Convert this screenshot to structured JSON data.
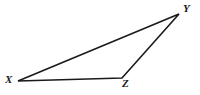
{
  "figure": {
    "type": "geometry-diagram",
    "shape": "triangle",
    "name": "Triangle XYZ",
    "background_color": "#ffffff",
    "stroke_color": "#1a1a1a",
    "stroke_width": 1.6,
    "canvas": {
      "width": 200,
      "height": 95
    },
    "vertices": [
      {
        "id": "X",
        "label": "X",
        "point": {
          "x": 18,
          "y": 81
        },
        "label_position": {
          "x": 5,
          "y": 74
        }
      },
      {
        "id": "Y",
        "label": "Y",
        "point": {
          "x": 179,
          "y": 14
        },
        "label_position": {
          "x": 183,
          "y": 3
        }
      },
      {
        "id": "Z",
        "label": "Z",
        "point": {
          "x": 122,
          "y": 78
        },
        "label_position": {
          "x": 122,
          "y": 78
        }
      }
    ],
    "edges": [
      {
        "id": "XY",
        "from": "X",
        "to": "Y"
      },
      {
        "id": "YZ",
        "from": "Y",
        "to": "Z"
      },
      {
        "id": "ZX",
        "from": "Z",
        "to": "X"
      }
    ],
    "polygon_points": "18,81 179,14 122,78"
  }
}
